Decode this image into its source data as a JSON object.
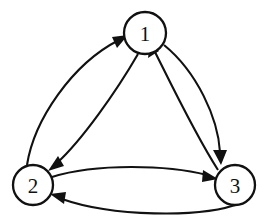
{
  "figure": {
    "type": "directed-graph",
    "background_color": "#ffffff",
    "stroke_color": "#111111",
    "node_fill_color": "#ffffff",
    "width": 269,
    "height": 221
  },
  "nodes": [
    {
      "id": "1",
      "label": "1",
      "cx": 145,
      "cy": 33,
      "r": 21
    },
    {
      "id": "2",
      "label": "2",
      "cx": 33,
      "cy": 185,
      "r": 20
    },
    {
      "id": "3",
      "label": "3",
      "cx": 235,
      "cy": 185,
      "r": 20
    }
  ],
  "edges": [
    {
      "from": "2",
      "to": "1",
      "name": "edge-2-to-1",
      "curve": "outer"
    },
    {
      "from": "1",
      "to": "2",
      "name": "edge-1-to-2",
      "curve": "inner"
    },
    {
      "from": "1",
      "to": "3",
      "name": "edge-1-to-3",
      "curve": "outer"
    },
    {
      "from": "3",
      "to": "1",
      "name": "edge-3-to-1",
      "curve": "inner"
    },
    {
      "from": "2",
      "to": "3",
      "name": "edge-2-to-3",
      "curve": "upper"
    },
    {
      "from": "3",
      "to": "2",
      "name": "edge-3-to-2",
      "curve": "lower"
    }
  ]
}
